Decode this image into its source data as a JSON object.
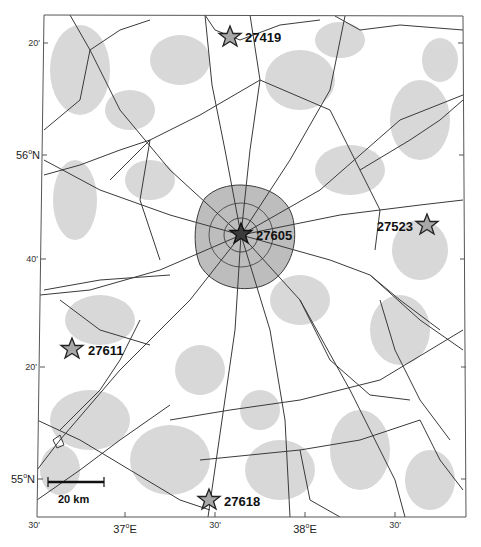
{
  "map": {
    "region": "Moscow region",
    "colors": {
      "background": "#ffffff",
      "urban_fill": "#d6d6d6",
      "city_fill": "#bdbdbd",
      "roads": "#3a3a3a",
      "frame": "#555555",
      "station_fill": "#a8a8a8",
      "center_station_fill": "#3c3c3c"
    },
    "stations": [
      {
        "id": "27419",
        "label": "27419",
        "x": 230,
        "y": 37,
        "label_side": "right",
        "highlight": false
      },
      {
        "id": "27605",
        "label": "27605",
        "x": 241,
        "y": 234,
        "label_side": "right",
        "highlight": true
      },
      {
        "id": "27523",
        "label": "27523",
        "x": 427,
        "y": 225,
        "label_side": "left",
        "highlight": false
      },
      {
        "id": "27611",
        "label": "27611",
        "x": 72,
        "y": 349,
        "label_side": "right",
        "highlight": false
      },
      {
        "id": "27618",
        "label": "27618",
        "x": 209,
        "y": 500,
        "label_side": "right",
        "highlight": false
      }
    ],
    "lat_ticks": [
      {
        "label": "20'",
        "y": 43
      },
      {
        "label": "56°N",
        "main": "56",
        "sup": "o",
        "suffix": "N",
        "y": 155
      },
      {
        "label": "40'",
        "y": 259
      },
      {
        "label": "20'",
        "y": 367
      },
      {
        "label": "55°N",
        "main": "55",
        "sup": "o",
        "suffix": "N",
        "y": 479
      }
    ],
    "lon_ticks": [
      {
        "label": "30'",
        "x": 34
      },
      {
        "label": "37°E",
        "main": "37",
        "sup": "o",
        "suffix": "E",
        "x": 125
      },
      {
        "label": "30'",
        "x": 215
      },
      {
        "label": "38°E",
        "main": "38",
        "sup": "o",
        "suffix": "E",
        "x": 305
      },
      {
        "label": "30'",
        "x": 395
      }
    ],
    "scale_bar": {
      "label": "20 km",
      "x1": 48,
      "x2": 104,
      "y": 482
    }
  }
}
